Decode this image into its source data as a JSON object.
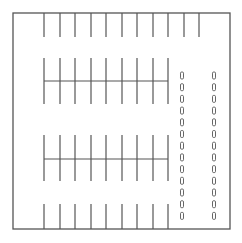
{
  "diagram": {
    "type": "parking-lot-layout",
    "colors": {
      "line": "#555555",
      "background": "#ffffff"
    },
    "border": {
      "x1": 13,
      "y1": 13,
      "x2": 230,
      "y2": 229
    },
    "stall_rows": [
      {
        "name": "top-row",
        "xs": [
          44,
          60,
          75,
          91,
          106,
          122,
          137,
          153,
          168,
          184,
          199
        ],
        "y1": 13,
        "y2": 37,
        "divider": false
      },
      {
        "name": "middle-row-1",
        "xs": [
          44,
          60,
          75,
          91,
          106,
          122,
          137,
          153,
          168
        ],
        "y1": 58,
        "y2": 104,
        "divider": true,
        "divider_y": 81
      },
      {
        "name": "middle-row-2",
        "xs": [
          44,
          60,
          75,
          91,
          106,
          122,
          137,
          153,
          168
        ],
        "y1": 135,
        "y2": 181,
        "divider": true,
        "divider_y": 159
      },
      {
        "name": "bottom-row",
        "xs": [
          44,
          60,
          75,
          91,
          106,
          122,
          137,
          153,
          168
        ],
        "y1": 204,
        "y2": 229,
        "divider": false
      }
    ],
    "dash_columns": [
      {
        "name": "dash-column-left",
        "x": 182
      },
      {
        "name": "dash-column-right",
        "x": 214
      }
    ],
    "dash": {
      "start_y": 72,
      "spacing": 11.7,
      "count": 13,
      "width": 3,
      "height": 7
    }
  }
}
